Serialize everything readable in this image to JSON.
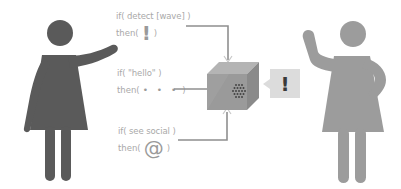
{
  "rules": [
    {
      "condition": "if( detect [wave] )",
      "then_prefix": "then(",
      "then_suffix": ")",
      "action_symbol": "!",
      "action_icon": "exclamation-icon"
    },
    {
      "condition": "if( \"hello\" )",
      "then_prefix": "then(",
      "then_suffix": ")",
      "action_symbol": "• • •",
      "action_icon": "ellipsis-icon"
    },
    {
      "condition": "if( see social )",
      "then_prefix": "then(",
      "then_suffix": ")",
      "action_symbol": "@",
      "action_icon": "at-sign-icon"
    }
  ],
  "device": {
    "icon": "cube-device-icon",
    "output_symbol": "!"
  },
  "figures": {
    "left": {
      "icon": "woman-pointing-icon",
      "color": "#5a5a5a"
    },
    "right": {
      "icon": "woman-waving-icon",
      "color": "#9c9c9c"
    }
  },
  "colors": {
    "text": "#a9a9a9",
    "connector": "#8f8f8f",
    "cube_front": "#9a9a9a",
    "cube_top": "#b4b4b4",
    "cube_side": "#8a8a8a",
    "speech_bubble": "#dcdcdc"
  }
}
